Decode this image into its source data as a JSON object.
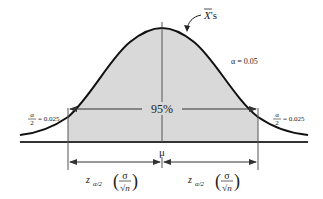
{
  "diagram": {
    "type": "normal-distribution-confidence-interval",
    "curve_label": "X's",
    "curve_label_overline": "X",
    "alpha_label": "α = 0.05",
    "center_label": "95%",
    "mean_label": "μ",
    "left_tail": {
      "numerator": "α",
      "denominator": "2",
      "value": "= 0.025"
    },
    "right_tail": {
      "numerator": "α",
      "denominator": "2",
      "value": "= 0.025"
    },
    "left_margin": {
      "z": "z",
      "subscript": "α/2",
      "sigma": "σ",
      "root_n": "√n"
    },
    "right_margin": {
      "z": "z",
      "subscript": "α/2",
      "sigma": "σ",
      "root_n": "√n"
    },
    "colors": {
      "curve": "#111111",
      "shaded_area": "#d9d9d9",
      "axis": "#333333",
      "text": "#222222"
    }
  }
}
